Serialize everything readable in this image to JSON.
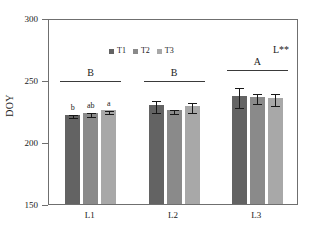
{
  "chart_data": {
    "type": "bar",
    "title": "",
    "xlabel": "",
    "ylabel": "DOY",
    "ylim": [
      150,
      300
    ],
    "yticks": [
      150,
      200,
      250,
      300
    ],
    "grid": false,
    "legend_position": "top-left",
    "categories": [
      "L1",
      "L2",
      "L3"
    ],
    "series": [
      {
        "name": "T1",
        "color": "#636363",
        "values": [
          222.0,
          230.0,
          237.0
        ],
        "errors": [
          1.0,
          5.0,
          8.0
        ]
      },
      {
        "name": "T2",
        "color": "#8a8a8a",
        "values": [
          223.5,
          226.0,
          236.0
        ],
        "errors": [
          1.5,
          1.5,
          4.0
        ]
      },
      {
        "name": "T3",
        "color": "#a8a8a8",
        "values": [
          225.5,
          229.0,
          235.5
        ],
        "errors": [
          1.5,
          4.0,
          5.0
        ]
      }
    ],
    "bar_letters": [
      {
        "group": "L1",
        "labels": [
          "b",
          "ab",
          "a"
        ]
      },
      {
        "group": "L2",
        "labels": [
          "",
          "",
          ""
        ]
      },
      {
        "group": "L3",
        "labels": [
          "",
          "",
          ""
        ]
      }
    ],
    "group_significance": [
      {
        "group": "L1",
        "letter": "B"
      },
      {
        "group": "L2",
        "letter": "B"
      },
      {
        "group": "L3",
        "letter": "A"
      }
    ],
    "annotation": "L**"
  },
  "axis": {
    "y_title": "DOY",
    "y_tick_labels": [
      "300",
      "250",
      "200",
      "150"
    ],
    "x_tick_labels": [
      "L1",
      "L2",
      "L3"
    ]
  },
  "legend": {
    "items": [
      {
        "label": "T1",
        "color": "#636363"
      },
      {
        "label": "T2",
        "color": "#8a8a8a"
      },
      {
        "label": "T3",
        "color": "#a8a8a8"
      }
    ]
  },
  "annotation": {
    "text": "L**"
  }
}
